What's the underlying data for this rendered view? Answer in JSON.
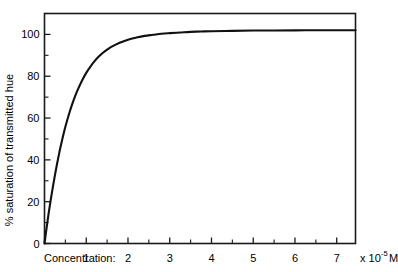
{
  "chart_data": {
    "type": "line",
    "title": "",
    "subtitle": "",
    "xlabel": "Concentration:",
    "xunit": "x 10",
    "xunit_exponent": "-5",
    "xunit_suffix": "M",
    "ylabel": "% saturation of transmitted hue",
    "xlim": [
      0,
      7.45
    ],
    "ylim": [
      0,
      110
    ],
    "xticks": [
      0,
      1,
      2,
      3,
      4,
      5,
      6,
      7
    ],
    "xticklabels": [
      "",
      "1",
      "2",
      "3",
      "4",
      "5",
      "6",
      "7"
    ],
    "xminorticks": [
      0.5,
      1.5,
      2.5,
      3.5,
      4.5,
      5.5,
      6.5
    ],
    "yticks": [
      0,
      20,
      40,
      60,
      80,
      100
    ],
    "yticklabels": [
      "0",
      "20",
      "40",
      "60",
      "80",
      "100"
    ],
    "yminorticks": [
      10,
      30,
      50,
      70,
      90,
      110
    ],
    "grid": false,
    "legend": false,
    "legend_position": "none",
    "series": [
      {
        "name": "saturation",
        "x": [
          0.0,
          0.05,
          0.1,
          0.15,
          0.2,
          0.25,
          0.3,
          0.35,
          0.4,
          0.5,
          0.6,
          0.7,
          0.8,
          0.9,
          1.0,
          1.1,
          1.2,
          1.3,
          1.4,
          1.5,
          1.6,
          1.8,
          2.0,
          2.2,
          2.4,
          2.6,
          2.8,
          3.0,
          3.25,
          3.5,
          3.75,
          4.0,
          4.5,
          5.0,
          5.5,
          6.0,
          6.5,
          7.0,
          7.45
        ],
        "y": [
          0.0,
          7.5,
          14.5,
          21.0,
          27.0,
          32.7,
          38.0,
          43.0,
          47.6,
          55.8,
          62.8,
          68.7,
          73.7,
          78.0,
          81.6,
          84.6,
          87.2,
          89.4,
          91.2,
          92.7,
          94.0,
          96.0,
          97.5,
          98.5,
          99.3,
          99.8,
          100.3,
          100.6,
          100.9,
          101.2,
          101.4,
          101.5,
          101.7,
          101.85,
          101.9,
          101.95,
          102.0,
          102.0,
          102.0
        ]
      }
    ],
    "annotations": [],
    "colors": {
      "curve": "#111111",
      "axis": "#1a1a1a",
      "background": "#ffffff",
      "text": "#000000"
    }
  }
}
